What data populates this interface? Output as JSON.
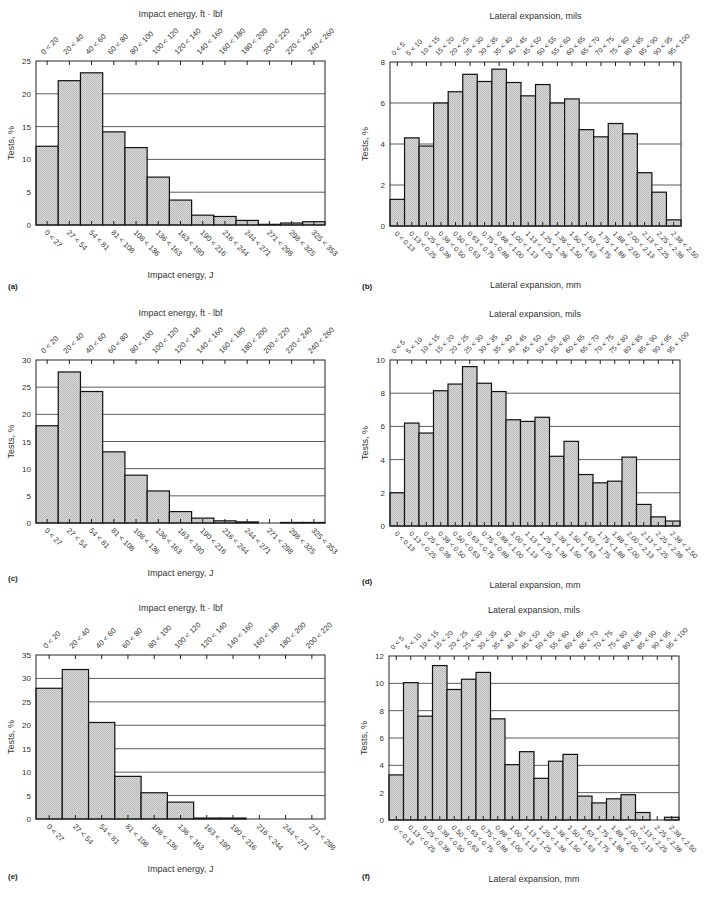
{
  "chart_data": [
    {
      "id": "a",
      "type": "bar",
      "panel_label": "(a)",
      "title": "",
      "top_xlabel": "Impact energy, ft · lbf",
      "xlabel": "Impact energy, J",
      "ylabel": "Tests, %",
      "ylim": [
        0,
        25
      ],
      "yticks": [
        0,
        5,
        10,
        15,
        20,
        25
      ],
      "grid": true,
      "categories": [
        "0 < 27",
        "27 < 54",
        "54 < 81",
        "81 < 108",
        "108 < 136",
        "136 < 163",
        "163 < 190",
        "190 < 216",
        "216 < 244",
        "244 < 271",
        "271 < 298",
        "298 < 325",
        "325 < 353"
      ],
      "top_categories": [
        "0 < 20",
        "20 < 40",
        "40 < 60",
        "60 < 80",
        "80 < 100",
        "100 < 120",
        "120 < 140",
        "140 < 160",
        "160 < 180",
        "180 < 200",
        "200 < 220",
        "220 < 240",
        "240 < 260"
      ],
      "values": [
        12.0,
        22.0,
        23.2,
        14.2,
        11.8,
        7.3,
        3.8,
        1.5,
        1.3,
        0.7,
        0.1,
        0.3,
        0.5
      ]
    },
    {
      "id": "b",
      "type": "bar",
      "panel_label": "(b)",
      "title": "",
      "top_xlabel": "Lateral expansion, mils",
      "xlabel": "Lateral expansion, mm",
      "ylabel": "Tests, %",
      "ylim": [
        0,
        8
      ],
      "yticks": [
        0,
        2,
        4,
        6,
        8
      ],
      "grid": true,
      "categories": [
        "0 < 0.13",
        "0.13 < 0.25",
        "0.25 < 0.38",
        "0.38 < 0.50",
        "0.50 < 0.63",
        "0.63 < 0.75",
        "0.75 < 0.88",
        "0.88 < 1.00",
        "1.00 < 1.13",
        "1.13 < 1.25",
        "1.25 < 1.38",
        "1.38 < 1.50",
        "1.50 < 1.63",
        "1.63 < 1.75",
        "1.75 < 1.88",
        "1.88 < 2.00",
        "2.00 < 2.13",
        "2.13 < 2.25",
        "2.25 < 2.38",
        "2.38 < 2.50"
      ],
      "top_categories": [
        "0 < 5",
        "5 < 10",
        "10 < 15",
        "15 < 20",
        "20 < 25",
        "25 < 30",
        "30 < 35",
        "35 < 40",
        "40 < 45",
        "45 < 50",
        "50 < 55",
        "55 < 60",
        "60 < 65",
        "65 < 70",
        "70 < 75",
        "75 < 80",
        "80 < 85",
        "85 < 90",
        "90 < 95",
        "95 < 100"
      ],
      "values": [
        1.3,
        4.3,
        3.9,
        6.0,
        6.55,
        7.4,
        7.05,
        7.65,
        7.0,
        6.35,
        6.9,
        6.0,
        6.2,
        4.7,
        4.35,
        5.0,
        4.5,
        2.6,
        1.65,
        0.3
      ]
    },
    {
      "id": "c",
      "type": "bar",
      "panel_label": "(c)",
      "title": "",
      "top_xlabel": "Impact energy, ft · lbf",
      "xlabel": "Impact energy, J",
      "ylabel": "Tests, %",
      "ylim": [
        0,
        30
      ],
      "yticks": [
        0,
        5,
        10,
        15,
        20,
        25,
        30
      ],
      "grid": true,
      "categories": [
        "0 < 27",
        "27 < 54",
        "54 < 81",
        "81 < 108",
        "108 < 136",
        "136 < 163",
        "163 < 190",
        "190 < 216",
        "216 < 244",
        "244 < 271",
        "271 < 298",
        "298 < 325",
        "325 < 353"
      ],
      "top_categories": [
        "0 < 20",
        "20 < 40",
        "40 < 60",
        "60 < 80",
        "80 < 100",
        "100 < 120",
        "120 < 140",
        "140 < 160",
        "160 < 180",
        "180 < 200",
        "200 < 220",
        "220 < 240",
        "240 < 260"
      ],
      "values": [
        17.9,
        27.8,
        24.2,
        13.1,
        8.8,
        5.9,
        2.1,
        0.9,
        0.4,
        0.2,
        0.0,
        0.1,
        0.1
      ]
    },
    {
      "id": "d",
      "type": "bar",
      "panel_label": "(d)",
      "title": "",
      "top_xlabel": "Lateral expansion, mils",
      "xlabel": "Lateral expansion, mm",
      "ylabel": "Tests, %",
      "ylim": [
        0,
        10
      ],
      "yticks": [
        0,
        2,
        4,
        6,
        8,
        10
      ],
      "grid": true,
      "categories": [
        "0 < 0.13",
        "0.13 < 0.25",
        "0.25 < 0.38",
        "0.38 < 0.50",
        "0.50 < 0.63",
        "0.63 < 0.75",
        "0.75 < 0.88",
        "0.88 < 1.00",
        "1.00 < 1.13",
        "1.13 < 1.25",
        "1.25 < 1.38",
        "1.38 < 1.50",
        "1.50 < 1.63",
        "1.63 < 1.75",
        "1.75 < 1.88",
        "1.88 < 2.00",
        "2.00 < 2.13",
        "2.13 < 2.25",
        "2.25 < 2.38",
        "2.38 < 2.50"
      ],
      "top_categories": [
        "0 < 5",
        "5 < 10",
        "10 < 15",
        "15 < 20",
        "20 < 25",
        "25 < 30",
        "30 < 35",
        "35 < 40",
        "40 < 45",
        "45 < 50",
        "50 < 55",
        "55 < 60",
        "60 < 65",
        "65 < 70",
        "70 < 75",
        "75 < 80",
        "80 < 85",
        "85 < 90",
        "90 < 95",
        "95 < 100"
      ],
      "values": [
        2.0,
        6.2,
        5.6,
        8.15,
        8.55,
        9.6,
        8.6,
        8.1,
        6.4,
        6.3,
        6.55,
        4.2,
        5.1,
        3.1,
        2.6,
        2.7,
        4.15,
        1.3,
        0.55,
        0.3
      ]
    },
    {
      "id": "e",
      "type": "bar",
      "panel_label": "(e)",
      "title": "",
      "top_xlabel": "Impact energy, ft · lbf",
      "xlabel": "Impact energy, J",
      "ylabel": "Tests, %",
      "ylim": [
        0,
        35
      ],
      "yticks": [
        0,
        5,
        10,
        15,
        20,
        25,
        30,
        35
      ],
      "grid": true,
      "categories": [
        "0 < 27",
        "27 < 54",
        "54 < 81",
        "81 < 108",
        "108 < 136",
        "136 < 163",
        "163 < 190",
        "190 < 216",
        "216 < 244",
        "244 < 271",
        "271 < 298"
      ],
      "top_categories": [
        "0 < 20",
        "20 < 40",
        "40 < 60",
        "60 < 80",
        "80 < 100",
        "100 < 120",
        "120 < 140",
        "140 < 160",
        "160 < 180",
        "180 < 200",
        "200 < 220"
      ],
      "values": [
        27.9,
        31.9,
        20.6,
        9.1,
        5.6,
        3.6,
        0.2,
        0.2,
        0.0,
        0.0,
        0.0
      ]
    },
    {
      "id": "f",
      "type": "bar",
      "panel_label": "(f)",
      "title": "",
      "top_xlabel": "Lateral expansion, mils",
      "xlabel": "Lateral expansion, mm",
      "ylabel": "Tests, %",
      "ylim": [
        0,
        12
      ],
      "yticks": [
        0,
        2,
        4,
        6,
        8,
        10,
        12
      ],
      "grid": true,
      "categories": [
        "0 < 0.13",
        "0.13 < 0.25",
        "0.25 < 0.38",
        "0.38 < 0.50",
        "0.50 < 0.63",
        "0.63 < 0.75",
        "0.75 < 0.88",
        "0.88 < 1.00",
        "1.00 < 1.13",
        "1.13 < 1.25",
        "1.25 < 1.38",
        "1.38 < 1.50",
        "1.50 < 1.63",
        "1.63 < 1.75",
        "1.75 < 1.88",
        "1.88 < 2.00",
        "2.00 < 2.13",
        "2.13 < 2.25",
        "2.25 < 2.38",
        "2.38 < 2.50"
      ],
      "top_categories": [
        "0 < 5",
        "5 < 10",
        "10 < 15",
        "15 < 20",
        "20 < 25",
        "25 < 30",
        "30 < 35",
        "35 < 40",
        "40 < 45",
        "45 < 50",
        "50 < 55",
        "55 < 60",
        "60 < 65",
        "65 < 70",
        "70 < 75",
        "75 < 80",
        "80 < 85",
        "85 < 90",
        "90 < 95",
        "95 < 100"
      ],
      "values": [
        3.3,
        10.05,
        7.6,
        11.3,
        9.55,
        10.3,
        10.8,
        7.4,
        4.05,
        5.0,
        3.05,
        4.3,
        4.8,
        1.75,
        1.25,
        1.55,
        1.85,
        0.55,
        0.0,
        0.2
      ]
    }
  ],
  "style": {
    "bar_fill": "#d6d6d6",
    "bar_stroke": "#111111",
    "grid_color": "#333333",
    "frame_color": "#222222",
    "text_color": "#333333"
  }
}
